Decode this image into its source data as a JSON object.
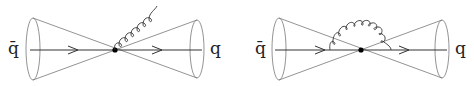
{
  "diagrams": [
    {
      "name": "real-gluon-emission",
      "incoming_label": "q̄",
      "outgoing_label": "q",
      "gluon": "emitted"
    },
    {
      "name": "virtual-gluon-loop",
      "incoming_label": "q̄",
      "outgoing_label": "q",
      "gluon": "loop"
    }
  ],
  "colors": {
    "line": "#333333",
    "cone": "#666666"
  }
}
